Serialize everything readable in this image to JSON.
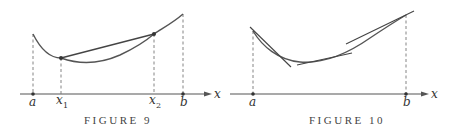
{
  "figures": [
    {
      "caption": "FIGURE 9",
      "axis_label": "x",
      "ticks": [
        {
          "label": "a",
          "sub": ""
        },
        {
          "label": "x",
          "sub": "1"
        },
        {
          "label": "x",
          "sub": "2"
        },
        {
          "label": "b",
          "sub": ""
        }
      ],
      "description": "Concave-up curve on [a,b] with secant line joining points at x1 and x2 lying above the curve"
    },
    {
      "caption": "FIGURE 10",
      "axis_label": "x",
      "ticks": [
        {
          "label": "a",
          "sub": ""
        },
        {
          "label": "b",
          "sub": ""
        }
      ],
      "description": "Concave-up curve on [a,b] with several tangent lines lying below the curve"
    }
  ],
  "colors": {
    "curve": "#555555",
    "axis": "#555555",
    "dashed": "#777777",
    "text": "#333333"
  }
}
